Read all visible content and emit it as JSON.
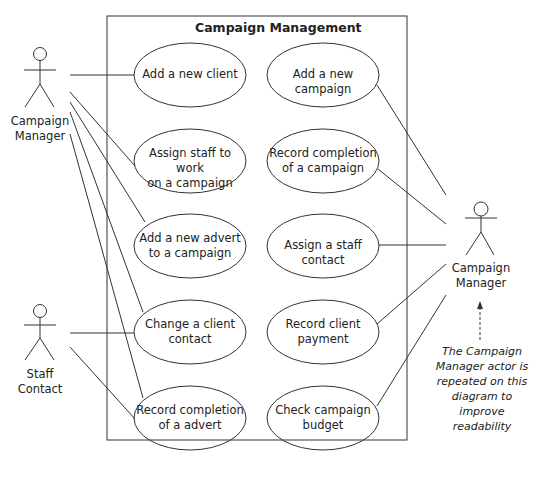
{
  "system": {
    "title": "Campaign Management"
  },
  "actors": [
    {
      "id": "cm_left",
      "label_line1": "Campaign",
      "label_line2": "Manager"
    },
    {
      "id": "staff",
      "label_line1": "Staff",
      "label_line2": "Contact"
    },
    {
      "id": "cm_right",
      "label_line1": "Campaign",
      "label_line2": "Manager"
    }
  ],
  "use_cases": [
    {
      "line1": "Add a new client",
      "line2": ""
    },
    {
      "line1": "Assign staff to work",
      "line2": "on a campaign"
    },
    {
      "line1": "Add a new advert",
      "line2": "to a campaign"
    },
    {
      "line1": "Change a client",
      "line2": "contact"
    },
    {
      "line1": "Record completion",
      "line2": "of a advert"
    },
    {
      "line1": "Add a new campaign",
      "line2": ""
    },
    {
      "line1": "Record completion",
      "line2": "of a campaign"
    },
    {
      "line1": "Assign a staff contact",
      "line2": ""
    },
    {
      "line1": "Record client",
      "line2": "payment"
    },
    {
      "line1": "Check campaign",
      "line2": "budget"
    }
  ],
  "note": {
    "line1": "The Campaign",
    "line2": "Manager actor is",
    "line3": "repeated on this",
    "line4": "diagram to improve",
    "line5": "readability"
  }
}
